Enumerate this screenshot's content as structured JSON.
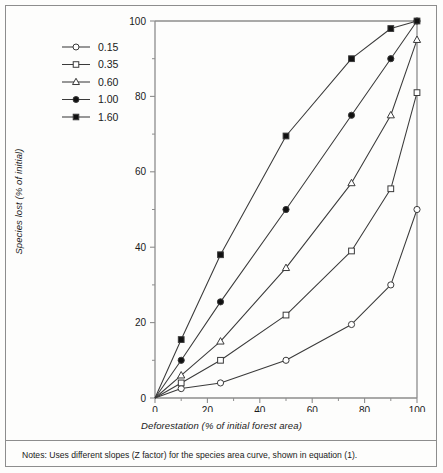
{
  "figure": {
    "notes": "Notes: Uses different slopes (Z factor) for the species area curve, shown in equation (1)."
  },
  "chart_data": {
    "type": "line",
    "title": "",
    "xlabel": "Deforestation (% of initial forest area)",
    "ylabel": "Species lost (% of initial)",
    "xlim": [
      0,
      100
    ],
    "ylim": [
      0,
      100
    ],
    "xticks": [
      0,
      20,
      40,
      60,
      80,
      100
    ],
    "yticks": [
      0,
      20,
      40,
      60,
      80,
      100
    ],
    "xtick_labels": [
      "0",
      "20",
      "40",
      "60",
      "80",
      "100"
    ],
    "ytick_labels": [
      "0",
      "20",
      "40",
      "60",
      "80",
      "100"
    ],
    "minor_xticks": [
      10,
      30,
      50,
      70,
      90
    ],
    "minor_yticks": [
      10,
      30,
      50,
      70,
      90
    ],
    "grid": false,
    "legend_position": "top-left",
    "legend_title": "",
    "x": [
      0,
      10,
      25,
      50,
      75,
      90,
      100
    ],
    "series": [
      {
        "name": "0.15",
        "marker": "open-circle",
        "values": [
          0,
          2.5,
          4.0,
          10.0,
          19.5,
          30.0,
          50.0
        ]
      },
      {
        "name": "0.35",
        "marker": "open-square",
        "values": [
          0,
          4.0,
          10.0,
          22.0,
          39.0,
          55.5,
          81.0
        ]
      },
      {
        "name": "0.60",
        "marker": "open-triangle",
        "values": [
          0,
          6.0,
          15.0,
          34.5,
          57.0,
          75.0,
          95.0
        ]
      },
      {
        "name": "1.00",
        "marker": "filled-circle",
        "values": [
          0,
          10.0,
          25.5,
          50.0,
          75.0,
          90.0,
          100.0
        ]
      },
      {
        "name": "1.60",
        "marker": "filled-square",
        "values": [
          0,
          15.5,
          38.0,
          69.5,
          90.0,
          98.0,
          100.0
        ]
      }
    ],
    "line_color": "#3a3a3a",
    "frame_color": "#8d8d8d"
  }
}
